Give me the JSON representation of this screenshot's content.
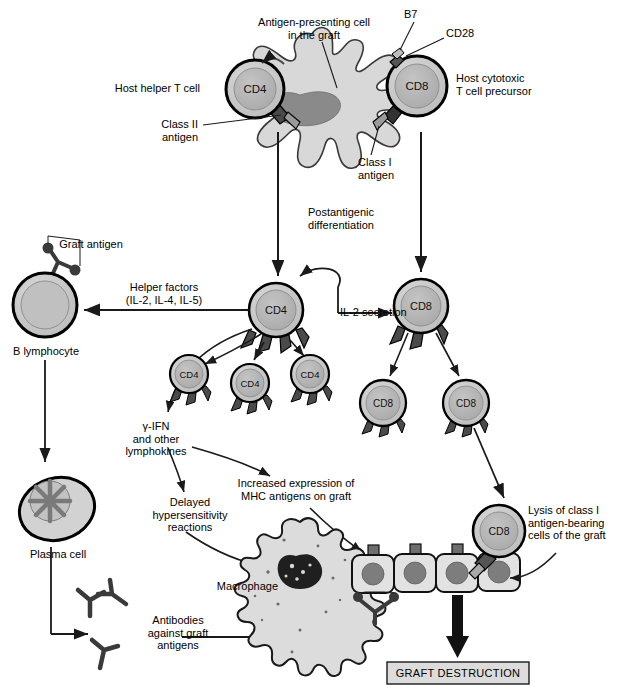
{
  "figure": {
    "type": "biological-pathway-diagram"
  },
  "colors": {
    "cell_outline": "#000000",
    "cell_fill_outer": "#c9c9c9",
    "cell_fill_inner": "#b0b0b0",
    "apc_fill": "#d8d8d8",
    "apc_nucleus": "#8a8a8a",
    "graft_cell_fill": "#e0e0e0",
    "graft_nucleus": "#7d7d7d",
    "arrow": "#1a1a1a",
    "box_fill": "#dcdcdc",
    "background": "#ffffff"
  },
  "labels": {
    "apc": "Antigen-presenting cell\nin the graft",
    "b7": "B7",
    "cd28": "CD28",
    "host_helper_t": "Host helper T cell",
    "host_cytotoxic_t": "Host cytotoxic\nT cell precursor",
    "class_ii_antigen": "Class II\nantigen",
    "class_i_antigen": "Class I\nantigen",
    "postantigenic": "Postantigenic\ndifferentiation",
    "graft_antigen": "Graft antigen",
    "helper_factors": "Helper factors\n(IL-2, IL-4, IL-5)",
    "b_lymphocyte": "B lymphocyte",
    "il2_secretion": "IL-2 secretion",
    "gamma_ifn": "γ-IFN\nand other\nlymphokines",
    "delayed_hypersensitivity": "Delayed\nhypersensitivity\nreactions",
    "increased_mhc": "Increased expression of\nMHC antigens on graft",
    "plasma_cell": "Plasma cell",
    "macrophage": "Macrophage",
    "antibodies": "Antibodies\nagainst graft\nantigens",
    "lysis": "Lysis of class I\nantigen-bearing\ncells of the graft",
    "graft_destruction": "GRAFT DESTRUCTION"
  },
  "cells": {
    "cd4_marker": "CD4",
    "cd8_marker": "CD8",
    "top_row": [
      {
        "name": "host-helper-t-cell",
        "marker": "CD4",
        "cx": 255,
        "cy": 89,
        "r": 29
      },
      {
        "name": "host-cytotoxic-t-cell-precursor",
        "marker": "CD8",
        "cx": 417,
        "cy": 86,
        "r": 30
      }
    ],
    "activated": [
      {
        "name": "activated-cd4",
        "marker": "CD4",
        "cx": 276,
        "cy": 310,
        "r": 27
      },
      {
        "name": "activated-cd8",
        "marker": "CD8",
        "cx": 421,
        "cy": 306,
        "r": 27
      }
    ],
    "clones_cd4": [
      {
        "marker": "CD4",
        "cx": 189,
        "cy": 374,
        "r": 19
      },
      {
        "marker": "CD4",
        "cx": 250,
        "cy": 383,
        "r": 19
      },
      {
        "marker": "CD4",
        "cx": 310,
        "cy": 374,
        "r": 19
      }
    ],
    "clones_cd8": [
      {
        "marker": "CD8",
        "cx": 383,
        "cy": 403,
        "r": 23
      },
      {
        "marker": "CD8",
        "cx": 466,
        "cy": 403,
        "r": 23
      }
    ],
    "effector_cd8": {
      "marker": "CD8",
      "cx": 499,
      "cy": 531,
      "r": 26
    },
    "b_lymphocyte": {
      "cx": 45,
      "cy": 305,
      "r": 32
    },
    "plasma_cell": {
      "cx": 57,
      "cy": 511
    },
    "macrophage": {
      "cx": 300,
      "cy": 565
    },
    "graft_cells_count": 4
  },
  "output_box": {
    "label": "GRAFT DESTRUCTION",
    "x": 387,
    "y": 662,
    "w": 142,
    "h": 22
  }
}
